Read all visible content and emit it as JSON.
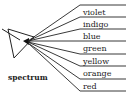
{
  "diagram": {
    "caption": "spectrum",
    "colors": [
      {
        "label": "violet",
        "top": 8
      },
      {
        "label": "indigo",
        "top": 20
      },
      {
        "label": "blue",
        "top": 32
      },
      {
        "label": "green",
        "top": 44
      },
      {
        "label": "yellow",
        "top": 57
      },
      {
        "label": "orange",
        "top": 69
      },
      {
        "label": "red",
        "top": 82
      }
    ],
    "bottom_text_partial": "...",
    "line_color": "#222222"
  }
}
